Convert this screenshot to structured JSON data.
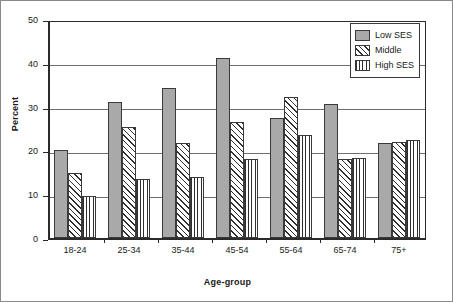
{
  "chart_data": {
    "type": "bar",
    "title": "",
    "xlabel": "Age-group",
    "ylabel": "Percent",
    "categories": [
      "18-24",
      "25-34",
      "35-44",
      "45-54",
      "55-64",
      "65-74",
      "75+"
    ],
    "series": [
      {
        "name": "Low SES",
        "values": [
          20.2,
          31.0,
          34.2,
          41.0,
          27.5,
          30.6,
          21.8
        ]
      },
      {
        "name": "Middle",
        "values": [
          14.8,
          25.4,
          21.6,
          26.5,
          32.1,
          18.0,
          22.0
        ]
      },
      {
        "name": "High SES",
        "values": [
          9.6,
          13.4,
          14.0,
          18.1,
          23.5,
          18.3,
          22.4
        ]
      }
    ],
    "ylim": [
      0,
      50
    ],
    "yticks": [
      0,
      10,
      20,
      30,
      40,
      50
    ],
    "ytick_labels": [
      "0",
      "10",
      "20",
      "30",
      "40",
      "50"
    ],
    "grid": "horizontal",
    "legend_position": "top-right",
    "legend": [
      "Low SES",
      "Middle",
      "High SES"
    ]
  },
  "legend": {
    "items": [
      {
        "label": "Low SES",
        "pattern": "solid-gray"
      },
      {
        "label": "Middle",
        "pattern": "diagonal-hatch"
      },
      {
        "label": "High SES",
        "pattern": "vertical-lines"
      }
    ]
  },
  "colors": {
    "series_low": "#a9a9a9",
    "series_mid": "#ffffff",
    "series_high": "#ffffff",
    "axis": "#2b2b2b",
    "grid": "#6f6f6f",
    "background": "#ffffff"
  }
}
